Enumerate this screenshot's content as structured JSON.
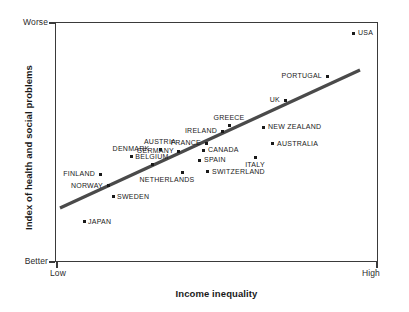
{
  "chart_data": {
    "type": "scatter",
    "title": "",
    "xlabel": "Income inequality",
    "ylabel": "Index of health and social problems",
    "x_axis_ticks": [
      "Low",
      "High"
    ],
    "y_axis_ticks": [
      "Worse",
      "Better"
    ],
    "xlim": [
      "Low",
      "High"
    ],
    "ylim": [
      "Better",
      "Worse"
    ],
    "grid": false,
    "legend": "none",
    "trendline": {
      "present": true,
      "description": "positive linear fit",
      "x_start": 60,
      "y_start": 208,
      "x_end": 360,
      "y_end": 70,
      "color": "#4a4a4a"
    },
    "points": [
      {
        "label": "USA",
        "px": 353,
        "py": 33,
        "label_side": "right",
        "label_dx": 5,
        "label_dy": -4
      },
      {
        "label": "PORTUGAL",
        "px": 327,
        "py": 76,
        "label_side": "left",
        "label_dx": -5,
        "label_dy": -4
      },
      {
        "label": "UK",
        "px": 285,
        "py": 100,
        "label_side": "left",
        "label_dx": -5,
        "label_dy": -4
      },
      {
        "label": "GREECE",
        "px": 229,
        "py": 125,
        "label_side": "above",
        "label_dx": 0,
        "label_dy": -11
      },
      {
        "label": "NEW ZEALAND",
        "px": 263,
        "py": 127,
        "label_side": "right",
        "label_dx": 5,
        "label_dy": -4
      },
      {
        "label": "IRELAND",
        "px": 222,
        "py": 131,
        "label_side": "left",
        "label_dx": -5,
        "label_dy": -4
      },
      {
        "label": "AUSTRALIA",
        "px": 272,
        "py": 143,
        "label_side": "right",
        "label_dx": 5,
        "label_dy": -3
      },
      {
        "label": "FRANCE",
        "px": 206,
        "py": 143,
        "label_side": "left",
        "label_dx": -5,
        "label_dy": -4
      },
      {
        "label": "AUSTRIA",
        "px": 160,
        "py": 149,
        "label_side": "above",
        "label_dx": 0,
        "label_dy": -11
      },
      {
        "label": "CANADA",
        "px": 203,
        "py": 150,
        "label_side": "right",
        "label_dx": 5,
        "label_dy": -4
      },
      {
        "label": "GERMANY",
        "px": 178,
        "py": 151,
        "label_side": "left",
        "label_dx": -4,
        "label_dy": -4
      },
      {
        "label": "DENMARK",
        "px": 131,
        "py": 156,
        "label_side": "above",
        "label_dx": 0,
        "label_dy": -11
      },
      {
        "label": "ITALY",
        "px": 255,
        "py": 157,
        "label_side": "below",
        "label_dx": 0,
        "label_dy": 4
      },
      {
        "label": "SPAIN",
        "px": 199,
        "py": 160,
        "label_side": "right",
        "label_dx": 5,
        "label_dy": -4
      },
      {
        "label": "BELGIUM",
        "px": 152,
        "py": 164,
        "label_side": "above",
        "label_dx": 0,
        "label_dy": -11
      },
      {
        "label": "SWITZERLAND",
        "px": 207,
        "py": 171,
        "label_side": "right",
        "label_dx": 5,
        "label_dy": -3
      },
      {
        "label": "NETHERLANDS",
        "px": 182,
        "py": 172,
        "label_side": "belowleft",
        "label_dx": -15,
        "label_dy": 4
      },
      {
        "label": "FINLAND",
        "px": 100,
        "py": 174,
        "label_side": "left",
        "label_dx": -5,
        "label_dy": -4
      },
      {
        "label": "NORWAY",
        "px": 108,
        "py": 185,
        "label_side": "left",
        "label_dx": -5,
        "label_dy": -3
      },
      {
        "label": "SWEDEN",
        "px": 113,
        "py": 196,
        "label_side": "right",
        "label_dx": 4,
        "label_dy": -3
      },
      {
        "label": "JAPAN",
        "px": 84,
        "py": 221,
        "label_side": "right",
        "label_dx": 4,
        "label_dy": -3
      }
    ]
  }
}
